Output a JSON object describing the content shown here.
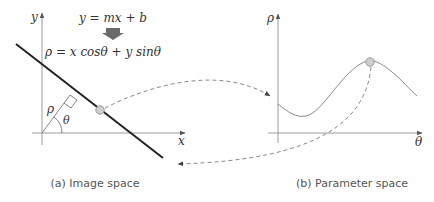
{
  "panel_a": {
    "caption": "(a) Image space",
    "axis_x_label": "x",
    "axis_y_label": "y",
    "equation_line": "y = mx + b",
    "equation_polar": "ρ = x cosθ + y sinθ",
    "rho_label": "ρ",
    "theta_label": "θ"
  },
  "panel_b": {
    "caption": "(b) Parameter space",
    "axis_x_label": "θ",
    "axis_y_label": "ρ"
  },
  "colors": {
    "axis": "#9a9a9a",
    "line": "#222222",
    "curve": "#8a8a8a",
    "dashed": "#8a8a8a",
    "point_fill": "#cfcfcf",
    "point_stroke": "#999999",
    "arrow_block": "#6b6b6b"
  }
}
